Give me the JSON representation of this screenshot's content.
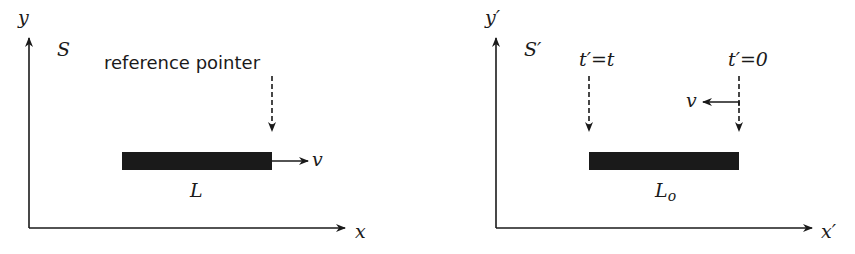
{
  "left_frame": {
    "frame_label": "S",
    "y_axis_label": "y",
    "x_axis_label": "x",
    "pointer_label": "reference pointer",
    "rod_label": "L",
    "velocity_label": "v"
  },
  "right_frame": {
    "frame_label": "S′",
    "y_axis_label": "y′",
    "x_axis_label": "x′",
    "left_pointer_label": "t′=t",
    "right_pointer_label": "t′=0",
    "rod_label": "L",
    "rod_label_subscript": "o",
    "velocity_label": "v"
  },
  "colors": {
    "ink": "#1a1a1a",
    "background": "#ffffff"
  }
}
